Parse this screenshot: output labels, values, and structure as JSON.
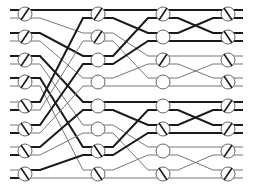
{
  "diagram": {
    "title": "",
    "type": "multistage switching network",
    "lines": 16,
    "stages": 4,
    "switches_per_stage": 8,
    "stage_x": [
      25,
      98,
      163,
      228
    ],
    "switch_y": [
      14,
      37,
      60,
      82,
      106,
      129,
      151,
      174
    ],
    "line_offset": 4,
    "switch_radius": 7,
    "colors": {
      "thin": "#777777",
      "thick": "#1a1a1a",
      "node_fill": "#ffffff",
      "node_stroke": "#666666"
    },
    "switch_states": [
      [
        "bar",
        "bar",
        "bar",
        "bar",
        "cross",
        "cross",
        "cross",
        "cross"
      ],
      [
        "bar",
        "bar",
        "idle",
        "idle",
        "idle",
        "idle",
        "cross",
        "cross"
      ],
      [
        "bar",
        "idle",
        "bar",
        "idle",
        "idle",
        "cross",
        "idle",
        "cross"
      ],
      [
        "cross",
        "cross",
        "cross",
        "cross",
        "bar",
        "bar",
        "bar",
        "bar"
      ]
    ],
    "connections": [
      {
        "from_stage": 0,
        "pattern": "perfect-shuffle",
        "block": 16
      },
      {
        "from_stage": 1,
        "pattern": "perfect-shuffle",
        "block": 8
      },
      {
        "from_stage": 2,
        "pattern": "perfect-shuffle",
        "block": 4
      }
    ],
    "thick_inputs": [
      0,
      2,
      4,
      6,
      9,
      11,
      13,
      15
    ]
  }
}
